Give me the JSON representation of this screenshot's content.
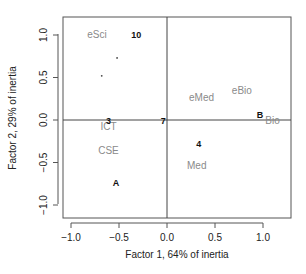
{
  "chart_data": {
    "type": "scatter",
    "title": "",
    "xlabel": "Factor 1, 64% of inertia",
    "ylabel": "Factor 2, 29% of inertia",
    "xlim": [
      -1.1,
      1.3
    ],
    "ylim": [
      -1.1,
      1.2
    ],
    "x_ticks": [
      -1.0,
      -0.5,
      0.0,
      0.5,
      1.0
    ],
    "x_tick_labels": [
      "−1.0",
      "−0.5",
      "0.0",
      "0.5",
      "1.0"
    ],
    "y_ticks": [
      -1.0,
      -0.5,
      0.0,
      0.5,
      1.0
    ],
    "y_tick_labels": [
      "−1.0",
      "−0.5",
      "0.0",
      "0.5",
      "1.0"
    ],
    "grid": false,
    "reference_lines": {
      "x": 0,
      "y": 0
    },
    "series": [
      {
        "name": "column categories",
        "color": "#8a8a8a",
        "points": [
          {
            "label": "eSci",
            "x": -0.73,
            "y": 1.01
          },
          {
            "label": "ICT",
            "x": -0.61,
            "y": -0.08
          },
          {
            "label": "CSE",
            "x": -0.61,
            "y": -0.36
          },
          {
            "label": "eMed",
            "x": 0.36,
            "y": 0.26
          },
          {
            "label": "eBio",
            "x": 0.78,
            "y": 0.35
          },
          {
            "label": "Bio",
            "x": 1.1,
            "y": -0.01
          },
          {
            "label": "Med",
            "x": 0.31,
            "y": -0.53
          }
        ]
      },
      {
        "name": "row categories",
        "color": "#111111",
        "points": [
          {
            "label": "10",
            "x": -0.32,
            "y": 1.01
          },
          {
            "label": "3",
            "x": -0.61,
            "y": 0.0
          },
          {
            "label": "7",
            "x": -0.04,
            "y": 0.0
          },
          {
            "label": "A",
            "x": -0.53,
            "y": -0.73
          },
          {
            "label": "B",
            "x": 0.97,
            "y": 0.06
          },
          {
            "label": "4",
            "x": 0.33,
            "y": -0.28
          }
        ]
      },
      {
        "name": "unlabeled points",
        "color": "#444444",
        "points": [
          {
            "label": "",
            "x": -0.52,
            "y": 0.73
          },
          {
            "label": "",
            "x": -0.68,
            "y": 0.52
          }
        ]
      }
    ]
  }
}
